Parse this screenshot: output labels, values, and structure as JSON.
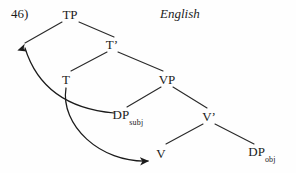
{
  "figure": {
    "example_number": "46)",
    "language": "English",
    "background_color": "#fefefe",
    "ink_color": "#1b1b1b"
  },
  "diagram": {
    "type": "syntax-tree",
    "nodes": [
      {
        "id": "TP",
        "label": "TP",
        "subscript": "",
        "prime": false,
        "x": 70,
        "y": 14
      },
      {
        "id": "Tbar",
        "label": "T",
        "subscript": "",
        "prime": true,
        "x": 112,
        "y": 44
      },
      {
        "id": "T",
        "label": "T",
        "subscript": "",
        "prime": false,
        "x": 66,
        "y": 79
      },
      {
        "id": "VP",
        "label": "VP",
        "subscript": "",
        "prime": false,
        "x": 167,
        "y": 79
      },
      {
        "id": "DPsubj",
        "label": "DP",
        "subscript": "subj",
        "prime": false,
        "x": 128,
        "y": 116
      },
      {
        "id": "Vbar",
        "label": "V",
        "subscript": "",
        "prime": true,
        "x": 209,
        "y": 116
      },
      {
        "id": "V",
        "label": "V",
        "subscript": "",
        "prime": false,
        "x": 161,
        "y": 153
      },
      {
        "id": "DPobj",
        "label": "DP",
        "subscript": "obj",
        "prime": false,
        "x": 262,
        "y": 153
      }
    ],
    "branches": [
      {
        "from": "TP",
        "to": "spec-TP",
        "path": "M 62 22 L 25 43"
      },
      {
        "from": "TP",
        "to": "Tbar",
        "path": "M 79 22 L 114 37"
      },
      {
        "from": "Tbar",
        "to": "T",
        "path": "M 107 52 L 71 71"
      },
      {
        "from": "Tbar",
        "to": "VP",
        "path": "M 118 52 L 163 71"
      },
      {
        "from": "VP",
        "to": "DPsubj",
        "path": "M 161 87 L 127 107"
      },
      {
        "from": "VP",
        "to": "Vbar",
        "path": "M 173 87 L 207 108"
      },
      {
        "from": "Vbar",
        "to": "V",
        "path": "M 203 124 L 166 144"
      },
      {
        "from": "Vbar",
        "to": "DPobj",
        "path": "M 215 124 L 254 144"
      }
    ],
    "movement_arrows": [
      {
        "id": "subject-raising",
        "from": "DPsubj",
        "to": "spec-TP",
        "path": "M 114 113 C 80 110, 40 96, 25 48",
        "description": "DP-subj raises to Spec,TP"
      },
      {
        "id": "verb-raising",
        "from": "T",
        "to": "V",
        "path": "M 66 88 C 60 125, 100 163, 148 161",
        "description": "V raises to T"
      }
    ]
  }
}
